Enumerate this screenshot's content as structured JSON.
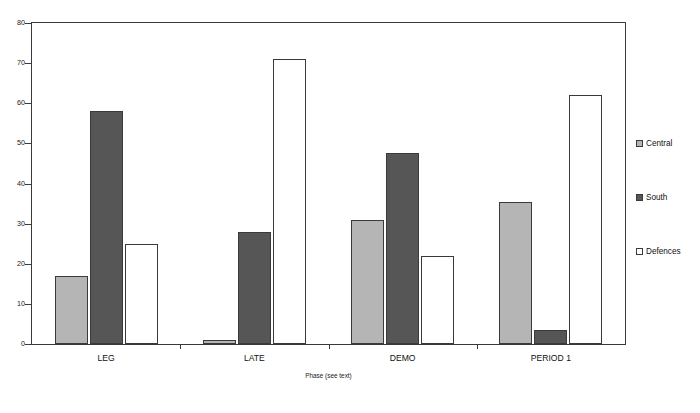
{
  "chart_data": {
    "type": "bar",
    "title": "",
    "subtitle": "",
    "xlabel": "Phase (see text)",
    "ylabel": "",
    "categories": [
      "LEG",
      "LATE",
      "DEMO",
      "PERIOD 1"
    ],
    "series": [
      {
        "name": "Central",
        "color": "#b5b5b5",
        "values": [
          17,
          1,
          31,
          35.5
        ]
      },
      {
        "name": "South",
        "color": "#565656",
        "values": [
          58,
          28,
          47.5,
          3.5
        ]
      },
      {
        "name": "Defences",
        "color": "#ffffff",
        "values": [
          25,
          71,
          22,
          62
        ]
      }
    ],
    "ylim": [
      0,
      80
    ],
    "yticks": [
      0,
      10,
      20,
      30,
      40,
      50,
      60,
      70,
      80
    ],
    "ytick_labels": [
      "0",
      "10",
      "20",
      "30",
      "40",
      "50",
      "60",
      "70",
      "80"
    ],
    "grid": false,
    "legend_position": "right",
    "frame": true
  },
  "axis": {
    "x_title": "Phase (see text)"
  },
  "legend": {
    "items": [
      {
        "label": "Central",
        "swatch": "legend-swatch-central"
      },
      {
        "label": "South",
        "swatch": "legend-swatch-south"
      },
      {
        "label": "Defences",
        "swatch": "legend-swatch-defences"
      }
    ]
  }
}
